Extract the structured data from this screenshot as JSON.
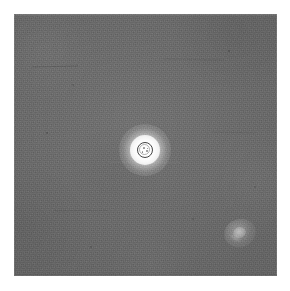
{
  "image": {
    "kind": "micrograph",
    "modality": "phase-contrast-grayscale",
    "frame": {
      "border_color": "#ffffff",
      "border_width_px": 14,
      "field_color": "#666666",
      "field_width_px": 263,
      "field_height_px": 262
    },
    "caption": "",
    "title": ""
  },
  "features": {
    "primary": {
      "name": "bright-halo-particle",
      "label": "",
      "center_x_px": 145,
      "center_y_px": 150,
      "halo_diameter_px": 52,
      "core_diameter_px": 30,
      "ring_diameter_px": 16,
      "ring_color": "#464646",
      "halo_color": "#ffffff"
    },
    "secondary": {
      "name": "faint-smudge",
      "label": "",
      "center_x_px": 240,
      "center_y_px": 233,
      "width_px": 32,
      "height_px": 28,
      "glow_color": "#ffffff"
    }
  },
  "palette": {
    "background": "#ffffff",
    "field_gray": "#666666",
    "field_gray_light": "#6e6e6e",
    "field_gray_dark": "#5c5c5c",
    "highlight": "#ffffff",
    "ring_dark": "#464646"
  },
  "annotations": {
    "scale_bar_text": "",
    "corner_label": ""
  }
}
